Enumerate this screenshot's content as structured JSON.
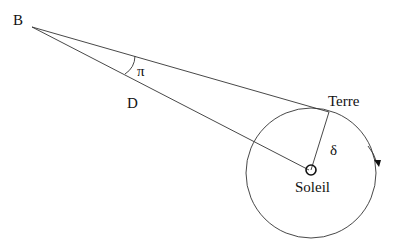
{
  "diagram": {
    "labels": {
      "star": "B",
      "angle": "π",
      "distance": "D",
      "earth": "Terre",
      "radius": "δ",
      "sun": "Soleil"
    },
    "colors": {
      "stroke": "#333333",
      "text": "#111111",
      "background": "#ffffff"
    }
  }
}
